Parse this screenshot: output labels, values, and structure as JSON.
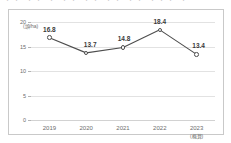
{
  "top_cut_strip": {
    "fragment": "・・  ・・  ・  ・・ ・・ ・・  ・・  ・・・ ・"
  },
  "chart_data": {
    "type": "line",
    "title": "",
    "xlabel": "",
    "ylabel": "(頭/ha)",
    "categories": [
      "2019",
      "2020",
      "2021",
      "2022",
      "2023"
    ],
    "category_sublabels": [
      "",
      "",
      "",
      "",
      "(概算)"
    ],
    "values": [
      16.8,
      13.7,
      14.8,
      18.4,
      13.4
    ],
    "value_labels": [
      "16.8",
      "13.7",
      "14.8",
      "18.4",
      "13.4"
    ],
    "ylim": [
      0,
      20
    ],
    "yticks": [
      20,
      15,
      10,
      5,
      0
    ],
    "ytick_labels": [
      "20",
      "15",
      "10",
      "5",
      "0"
    ],
    "grid": true,
    "legend": false,
    "marker": "open-circle",
    "colors": {
      "line": "#4d4d4d",
      "marker_fill": "#ffffff",
      "gridline": "#e2e2e2",
      "border": "#c9c9c9",
      "text": "#6d6d6d",
      "value_text": "#3a3a3a",
      "background": "#ffffff"
    }
  }
}
